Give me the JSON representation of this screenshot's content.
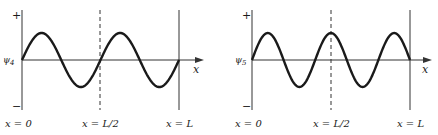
{
  "colors": {
    "ink": "#1a1a1a",
    "axis": "#333333",
    "background": "#ffffff"
  },
  "panels": [
    {
      "id": "psi4",
      "psi_label": "ψ",
      "psi_sub": "4",
      "plus": "+",
      "minus": "−",
      "x_axis_label": "x",
      "bottom_labels": [
        "x = 0",
        "x = L/2",
        "x = L"
      ],
      "half_wavelengths": 4
    },
    {
      "id": "psi5",
      "psi_label": "ψ",
      "psi_sub": "5",
      "plus": "+",
      "minus": "−",
      "x_axis_label": "x",
      "bottom_labels": [
        "x = 0",
        "x = L/2",
        "x = L"
      ],
      "half_wavelengths": 5
    }
  ]
}
